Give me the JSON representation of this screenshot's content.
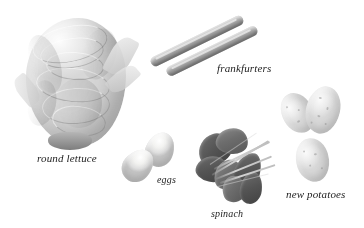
{
  "plate": {
    "background_color": "#ffffff",
    "width": 364,
    "height": 228,
    "style": "grayscale photographic reference plate",
    "label_color": "#1c1c1c"
  },
  "items": [
    {
      "id": "round-lettuce",
      "label": "round lettuce",
      "label_x": 37,
      "label_y": 153,
      "label_size": 11,
      "count": 1,
      "tone": "light gray"
    },
    {
      "id": "frankfurters",
      "label": "frankfurters",
      "label_x": 217,
      "label_y": 63,
      "label_size": 11,
      "count": 2,
      "tone": "mid gray"
    },
    {
      "id": "eggs",
      "label": "eggs",
      "label_x": 157,
      "label_y": 175,
      "label_size": 10,
      "count": 2,
      "tone": "pale gray"
    },
    {
      "id": "spinach",
      "label": "spinach",
      "label_x": 211,
      "label_y": 209,
      "label_size": 10,
      "count": 1,
      "tone": "dark gray"
    },
    {
      "id": "new-potatoes",
      "label": "new potatoes",
      "label_x": 286,
      "label_y": 189,
      "label_size": 11,
      "count": 3,
      "tone": "light gray"
    }
  ]
}
